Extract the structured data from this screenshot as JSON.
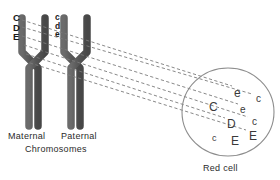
{
  "diagram": {
    "colors": {
      "chromosome": "#5c5c5c",
      "chromosome_edge": "#3d3d3d",
      "line": "#777777",
      "cell_outline": "#8a8a8a",
      "text": "#2b2b2b"
    }
  },
  "chromosomes": {
    "maternal": {
      "name": "Maternal",
      "genes": [
        "C",
        "D",
        "E"
      ]
    },
    "paternal": {
      "name": "Paternal",
      "genes": [
        "c",
        "d",
        "e"
      ]
    }
  },
  "captions": {
    "maternal": "Maternal",
    "paternal": "Paternal",
    "chromosomes": "Chromosomes",
    "red_cell": "Red cell"
  },
  "red_cell": {
    "label": "Red cell",
    "antigens": [
      {
        "text": "e",
        "x": 234,
        "y": 88,
        "size": "big"
      },
      {
        "text": "c",
        "x": 256,
        "y": 94,
        "size": "norm"
      },
      {
        "text": "C",
        "x": 209,
        "y": 102,
        "size": "big"
      },
      {
        "text": "e",
        "x": 240,
        "y": 105,
        "size": "norm"
      },
      {
        "text": "c",
        "x": 252,
        "y": 117,
        "size": "norm"
      },
      {
        "text": "D",
        "x": 227,
        "y": 119,
        "size": "big"
      },
      {
        "text": "c",
        "x": 212,
        "y": 133,
        "size": "small"
      },
      {
        "text": "E",
        "x": 231,
        "y": 136,
        "size": "big"
      },
      {
        "text": "E",
        "x": 249,
        "y": 131,
        "size": "big"
      }
    ]
  },
  "projection_lines": {
    "count": 6,
    "style": "dashed",
    "description": "Dashed lines linking chromosome gene loci to red cell antigens"
  }
}
